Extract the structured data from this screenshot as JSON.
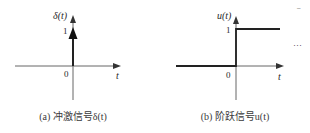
{
  "panels": [
    {
      "id": "a",
      "y_label": "δ(t)",
      "x_label": "t",
      "origin_label": "0",
      "level_label": "1",
      "caption": "(a) 冲激信号δ(t)"
    },
    {
      "id": "b",
      "y_label": "u(t)",
      "x_label": "t",
      "origin_label": "0",
      "level_label": "1",
      "caption": "(b) 阶跃信号u(t)",
      "continuation": "···"
    }
  ],
  "corner_mark": "–",
  "colors": {
    "line": "#2a2a2a",
    "axis": "#555555",
    "background": "#ffffff"
  }
}
